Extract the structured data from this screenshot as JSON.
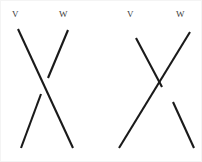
{
  "canvas": {
    "width": 202,
    "height": 162,
    "background": "#ffffff",
    "border_color": "#f4f4f4"
  },
  "style": {
    "stroke_color": "#1a1a1a",
    "stroke_width": 2.1,
    "label_color": "#3a3a3a",
    "label_font_size": 9
  },
  "figures": [
    {
      "id": "left-crossing",
      "name": "left-crossing-diagram",
      "description": "Two line strands crossing; the strand descending from W is broken at the crossing so the strand descending from V passes over it.",
      "over_strand": "V",
      "under_strand": "W",
      "labels": [
        {
          "text": "V",
          "x": 11,
          "y": 9
        },
        {
          "text": "W",
          "x": 58,
          "y": 9
        }
      ],
      "strands": [
        {
          "name": "v-strand",
          "label": "V",
          "continuous": true,
          "segments": [
            {
              "x1": 17,
              "y1": 28,
              "x2": 72,
              "y2": 147
            }
          ]
        },
        {
          "name": "w-strand",
          "label": "W",
          "continuous": false,
          "segments": [
            {
              "x1": 67,
              "y1": 29,
              "x2": 47,
              "y2": 77
            },
            {
              "x1": 40,
              "y1": 93,
              "x2": 20,
              "y2": 147
            }
          ]
        }
      ]
    },
    {
      "id": "right-crossing",
      "name": "right-crossing-diagram",
      "description": "Two line strands crossing; the strand descending from V is broken at the crossing so the strand descending from W passes over it.",
      "over_strand": "W",
      "under_strand": "V",
      "labels": [
        {
          "text": "V",
          "x": 126,
          "y": 9
        },
        {
          "text": "W",
          "x": 175,
          "y": 9
        }
      ],
      "strands": [
        {
          "name": "w-strand",
          "label": "W",
          "continuous": true,
          "segments": [
            {
              "x1": 189,
              "y1": 31,
              "x2": 118,
              "y2": 147
            }
          ]
        },
        {
          "name": "v-strand",
          "label": "V",
          "continuous": false,
          "segments": [
            {
              "x1": 135,
              "y1": 37,
              "x2": 161,
              "y2": 86
            },
            {
              "x1": 172,
              "y1": 101,
              "x2": 193,
              "y2": 147
            }
          ]
        }
      ]
    }
  ]
}
